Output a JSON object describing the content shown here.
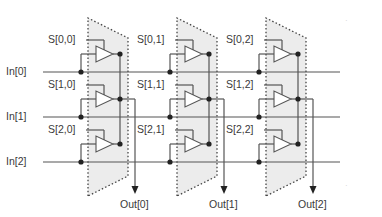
{
  "diagram": {
    "colors": {
      "wire": "#555555",
      "dot": "#222222",
      "panel_fill": "#ececec",
      "dotted_border": "#444444",
      "text": "#3a3a3a"
    },
    "inputs": [
      {
        "label": "In[0]",
        "y": 72
      },
      {
        "label": "In[1]",
        "y": 117
      },
      {
        "label": "In[2]",
        "y": 162
      }
    ],
    "outputs": [
      {
        "label": "Out[0]",
        "x": 135
      },
      {
        "label": "Out[1]",
        "x": 224
      },
      {
        "label": "Out[2]",
        "x": 313
      }
    ],
    "selects": [
      [
        "S[0,0]",
        "S[0,1]",
        "S[0,2]"
      ],
      [
        "S[1,0]",
        "S[1,1]",
        "S[1,2]"
      ],
      [
        "S[2,0]",
        "S[2,1]",
        "S[2,2]"
      ]
    ],
    "columns": [
      {
        "left": 88,
        "bus_x": 120,
        "right": 128
      },
      {
        "left": 177,
        "bus_x": 209,
        "right": 217
      },
      {
        "left": 266,
        "bus_x": 298,
        "right": 306
      }
    ],
    "rows": [
      {
        "buffer_y": 54,
        "select_y": 40
      },
      {
        "buffer_y": 99,
        "select_y": 85
      },
      {
        "buffer_y": 144,
        "select_y": 130
      }
    ]
  }
}
